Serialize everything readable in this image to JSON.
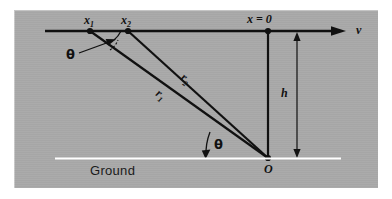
{
  "figure": {
    "kind": "physics-geometry-diagram",
    "panel_background": "#a9a9a9",
    "ink_color": "#111111",
    "ground_line_color": "#ffffff",
    "labels": {
      "x1": "x",
      "x1_sub": "1",
      "x2": "x",
      "x2_sub": "2",
      "x_zero": "x = 0",
      "velocity": "v",
      "r1": "r",
      "r1_sub": "1",
      "r2": "r",
      "r2_sub": "2",
      "height": "h",
      "origin": "O",
      "theta_top": "θ",
      "theta_bottom": "θ",
      "ground": "Ground"
    },
    "points": {
      "x1": {
        "x": 90,
        "y": 31
      },
      "x2": {
        "x": 128,
        "y": 31
      },
      "x_zero": {
        "x": 268,
        "y": 31
      },
      "origin": {
        "x": 268,
        "y": 158
      }
    },
    "geometry": {
      "axis_y": 31,
      "axis_start_x": 45,
      "axis_end_x": 345,
      "ground_y": 158,
      "ground_start_x": 55,
      "ground_end_x": 341,
      "height_arrow_x": 297,
      "theta_degrees_note": "angle between horizontal axis and r1 at x1, and between ground and r1 at O"
    }
  }
}
